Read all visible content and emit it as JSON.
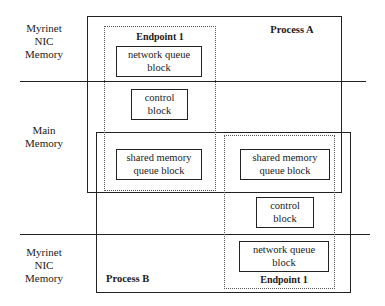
{
  "regions": {
    "top_nic": "Myrinet\nNIC\nMemory",
    "main": "Main\nMemory",
    "bottom_nic": "Myrinet\nNIC\nMemory"
  },
  "process_a": {
    "label": "Process A",
    "endpoint": {
      "label": "Endpoint 1",
      "network_block": "network queue\nblock",
      "control_block": "control\nblock",
      "shared_block": "shared memory\nqueue block"
    }
  },
  "process_b": {
    "label": "Process B",
    "endpoint": {
      "label": "Endpoint 1",
      "shared_block": "shared memory\nqueue block",
      "control_block": "control\nblock",
      "network_block": "network queue\nblock"
    }
  }
}
